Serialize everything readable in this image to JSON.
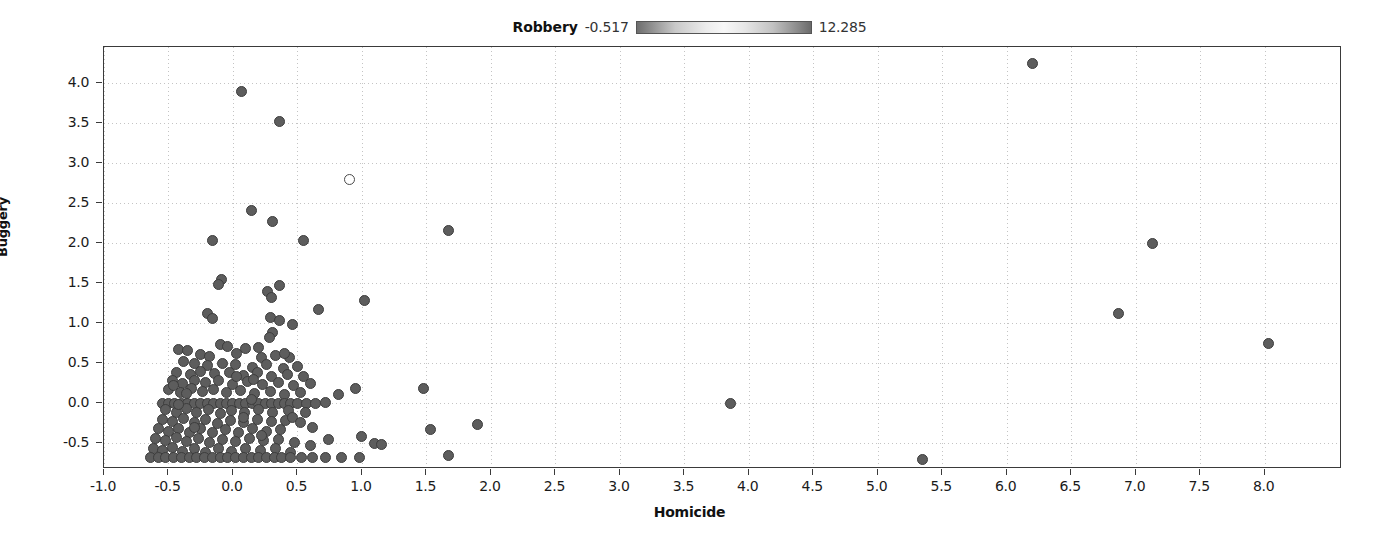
{
  "legend": {
    "title": "Robbery",
    "min": "-0.517",
    "max": "12.285",
    "colorbar_name": "robbery-colorbar",
    "gradient_low": "#6e6e6e",
    "gradient_mid": "#f7f7f7",
    "gradient_high": "#6b6b6b"
  },
  "chart_data": {
    "type": "scatter",
    "title": "Robbery",
    "xlabel": "Homicide",
    "ylabel": "Buggery",
    "xlim": [
      -1.0,
      8.6
    ],
    "ylim": [
      -0.82,
      4.45
    ],
    "grid": true,
    "legend_position": "top-center",
    "colorbar": {
      "label": "Robbery",
      "vmin": -0.517,
      "vmax": 12.285
    },
    "xticks": [
      "-1.0",
      "-0.5",
      "0.0",
      "0.5",
      "1.0",
      "1.5",
      "2.0",
      "2.5",
      "3.0",
      "3.5",
      "4.0",
      "4.5",
      "5.0",
      "5.5",
      "6.0",
      "6.5",
      "7.0",
      "7.5",
      "8.0"
    ],
    "xtickvalues": [
      -1.0,
      -0.5,
      0.0,
      0.5,
      1.0,
      1.5,
      2.0,
      2.5,
      3.0,
      3.5,
      4.0,
      4.5,
      5.0,
      5.5,
      6.0,
      6.5,
      7.0,
      7.5,
      8.0
    ],
    "yticks": [
      "-0.5",
      "0.0",
      "0.5",
      "1.0",
      "1.5",
      "2.0",
      "2.5",
      "3.0",
      "3.5",
      "4.0"
    ],
    "ytickvalues": [
      -0.5,
      0.0,
      0.5,
      1.0,
      1.5,
      2.0,
      2.5,
      3.0,
      3.5,
      4.0
    ],
    "marker": {
      "shape": "circle",
      "fill": "#5d5d5d",
      "edge": "#3d3d3d",
      "size_px": 11
    },
    "points": [
      [
        6.2,
        4.25
      ],
      [
        0.07,
        3.9
      ],
      [
        0.36,
        3.52
      ],
      [
        0.9,
        2.8
      ],
      [
        0.14,
        2.41
      ],
      [
        0.31,
        2.27
      ],
      [
        1.67,
        2.16
      ],
      [
        7.13,
        2.0
      ],
      [
        -0.16,
        2.03
      ],
      [
        0.55,
        2.03
      ],
      [
        -0.09,
        1.55
      ],
      [
        -0.11,
        1.48
      ],
      [
        0.36,
        1.47
      ],
      [
        0.27,
        1.4
      ],
      [
        0.3,
        1.32
      ],
      [
        1.02,
        1.29
      ],
      [
        6.87,
        1.12
      ],
      [
        -0.2,
        1.12
      ],
      [
        -0.16,
        1.06
      ],
      [
        0.29,
        1.07
      ],
      [
        0.36,
        1.03
      ],
      [
        0.46,
        0.99
      ],
      [
        0.66,
        1.17
      ],
      [
        0.31,
        0.88
      ],
      [
        0.28,
        0.82
      ],
      [
        8.03,
        0.75
      ],
      [
        -0.42,
        0.67
      ],
      [
        -0.35,
        0.66
      ],
      [
        -0.1,
        0.73
      ],
      [
        -0.04,
        0.71
      ],
      [
        0.1,
        0.69
      ],
      [
        0.2,
        0.7
      ],
      [
        -0.25,
        0.61
      ],
      [
        -0.18,
        0.59
      ],
      [
        0.03,
        0.62
      ],
      [
        0.22,
        0.57
      ],
      [
        0.33,
        0.6
      ],
      [
        0.44,
        0.57
      ],
      [
        -0.38,
        0.52
      ],
      [
        -0.3,
        0.5
      ],
      [
        -0.2,
        0.47
      ],
      [
        -0.08,
        0.5
      ],
      [
        0.02,
        0.48
      ],
      [
        0.15,
        0.45
      ],
      [
        0.26,
        0.48
      ],
      [
        0.39,
        0.44
      ],
      [
        0.5,
        0.46
      ],
      [
        -0.44,
        0.38
      ],
      [
        -0.33,
        0.36
      ],
      [
        -0.25,
        0.4
      ],
      [
        -0.14,
        0.37
      ],
      [
        -0.03,
        0.39
      ],
      [
        0.08,
        0.35
      ],
      [
        0.19,
        0.38
      ],
      [
        0.3,
        0.34
      ],
      [
        0.42,
        0.36
      ],
      [
        0.55,
        0.33
      ],
      [
        -0.47,
        0.28
      ],
      [
        -0.39,
        0.25
      ],
      [
        -0.3,
        0.29
      ],
      [
        -0.21,
        0.26
      ],
      [
        -0.11,
        0.28
      ],
      [
        0.0,
        0.24
      ],
      [
        0.11,
        0.27
      ],
      [
        0.23,
        0.23
      ],
      [
        0.35,
        0.26
      ],
      [
        0.47,
        0.22
      ],
      [
        0.6,
        0.25
      ],
      [
        -0.5,
        0.17
      ],
      [
        -0.41,
        0.14
      ],
      [
        -0.32,
        0.18
      ],
      [
        -0.24,
        0.15
      ],
      [
        -0.15,
        0.17
      ],
      [
        -0.05,
        0.13
      ],
      [
        0.06,
        0.16
      ],
      [
        0.17,
        0.12
      ],
      [
        0.29,
        0.15
      ],
      [
        0.4,
        0.11
      ],
      [
        0.52,
        0.14
      ],
      [
        1.48,
        0.18
      ],
      [
        0.95,
        0.18
      ],
      [
        0.82,
        0.11
      ],
      [
        -0.55,
        0.0
      ],
      [
        -0.5,
        0.0
      ],
      [
        -0.45,
        0.0
      ],
      [
        -0.4,
        0.0
      ],
      [
        -0.35,
        0.0
      ],
      [
        -0.3,
        0.0
      ],
      [
        -0.25,
        0.0
      ],
      [
        -0.2,
        0.0
      ],
      [
        -0.15,
        0.0
      ],
      [
        -0.1,
        0.0
      ],
      [
        -0.05,
        0.0
      ],
      [
        0.0,
        0.0
      ],
      [
        0.05,
        0.0
      ],
      [
        0.1,
        0.0
      ],
      [
        0.15,
        0.0
      ],
      [
        0.2,
        0.0
      ],
      [
        0.25,
        0.0
      ],
      [
        0.3,
        0.0
      ],
      [
        0.35,
        0.0
      ],
      [
        0.4,
        0.0
      ],
      [
        0.45,
        0.0
      ],
      [
        0.5,
        0.0
      ],
      [
        0.57,
        0.0
      ],
      [
        0.64,
        0.0
      ],
      [
        0.72,
        0.01
      ],
      [
        3.86,
        0.0
      ],
      [
        -0.52,
        -0.08
      ],
      [
        -0.44,
        -0.11
      ],
      [
        -0.36,
        -0.07
      ],
      [
        -0.28,
        -0.12
      ],
      [
        -0.19,
        -0.08
      ],
      [
        -0.1,
        -0.13
      ],
      [
        -0.01,
        -0.09
      ],
      [
        0.09,
        -0.12
      ],
      [
        0.2,
        -0.08
      ],
      [
        0.31,
        -0.11
      ],
      [
        0.43,
        -0.09
      ],
      [
        0.56,
        -0.12
      ],
      [
        1.9,
        -0.26
      ],
      [
        -0.55,
        -0.2
      ],
      [
        -0.47,
        -0.23
      ],
      [
        -0.38,
        -0.19
      ],
      [
        -0.3,
        -0.24
      ],
      [
        -0.21,
        -0.2
      ],
      [
        -0.12,
        -0.25
      ],
      [
        -0.02,
        -0.21
      ],
      [
        0.08,
        -0.24
      ],
      [
        0.19,
        -0.2
      ],
      [
        0.3,
        -0.23
      ],
      [
        0.41,
        -0.21
      ],
      [
        1.53,
        -0.33
      ],
      [
        -0.58,
        -0.32
      ],
      [
        -0.5,
        -0.35
      ],
      [
        -0.42,
        -0.31
      ],
      [
        -0.34,
        -0.36
      ],
      [
        -0.25,
        -0.32
      ],
      [
        -0.16,
        -0.37
      ],
      [
        -0.06,
        -0.33
      ],
      [
        0.04,
        -0.36
      ],
      [
        0.15,
        -0.32
      ],
      [
        0.26,
        -0.35
      ],
      [
        0.37,
        -0.33
      ],
      [
        1.0,
        -0.42
      ],
      [
        1.1,
        -0.5
      ],
      [
        1.15,
        -0.52
      ],
      [
        -0.6,
        -0.44
      ],
      [
        -0.52,
        -0.47
      ],
      [
        -0.44,
        -0.43
      ],
      [
        -0.36,
        -0.48
      ],
      [
        -0.27,
        -0.44
      ],
      [
        -0.18,
        -0.49
      ],
      [
        -0.08,
        -0.45
      ],
      [
        0.02,
        -0.48
      ],
      [
        0.13,
        -0.44
      ],
      [
        0.24,
        -0.47
      ],
      [
        0.35,
        -0.45
      ],
      [
        0.48,
        -0.49
      ],
      [
        0.6,
        -0.53
      ],
      [
        1.67,
        -0.65
      ],
      [
        5.35,
        -0.7
      ],
      [
        -0.62,
        -0.56
      ],
      [
        -0.55,
        -0.59
      ],
      [
        -0.47,
        -0.55
      ],
      [
        -0.39,
        -0.6
      ],
      [
        -0.3,
        -0.56
      ],
      [
        -0.21,
        -0.61
      ],
      [
        -0.11,
        -0.57
      ],
      [
        -0.01,
        -0.6
      ],
      [
        0.1,
        -0.56
      ],
      [
        0.21,
        -0.59
      ],
      [
        0.33,
        -0.57
      ],
      [
        0.45,
        -0.61
      ],
      [
        -0.64,
        -0.68
      ],
      [
        -0.58,
        -0.68
      ],
      [
        -0.52,
        -0.68
      ],
      [
        -0.46,
        -0.68
      ],
      [
        -0.4,
        -0.68
      ],
      [
        -0.34,
        -0.68
      ],
      [
        -0.28,
        -0.68
      ],
      [
        -0.22,
        -0.68
      ],
      [
        -0.16,
        -0.68
      ],
      [
        -0.1,
        -0.68
      ],
      [
        -0.04,
        -0.68
      ],
      [
        0.02,
        -0.68
      ],
      [
        0.08,
        -0.68
      ],
      [
        0.14,
        -0.68
      ],
      [
        0.2,
        -0.68
      ],
      [
        0.26,
        -0.68
      ],
      [
        0.32,
        -0.68
      ],
      [
        0.38,
        -0.68
      ],
      [
        0.45,
        -0.68
      ],
      [
        0.53,
        -0.68
      ],
      [
        0.62,
        -0.68
      ],
      [
        0.72,
        -0.68
      ],
      [
        0.84,
        -0.68
      ],
      [
        0.98,
        -0.68
      ],
      [
        -0.46,
        0.22
      ],
      [
        -0.42,
        -0.02
      ],
      [
        -0.36,
        0.12
      ],
      [
        -0.3,
        -0.3
      ],
      [
        0.16,
        0.3
      ],
      [
        0.22,
        -0.4
      ],
      [
        0.08,
        -0.18
      ],
      [
        0.14,
        0.05
      ],
      [
        0.03,
        0.33
      ],
      [
        0.46,
        -0.18
      ],
      [
        0.52,
        -0.24
      ],
      [
        0.62,
        -0.3
      ],
      [
        0.74,
        -0.45
      ],
      [
        0.4,
        0.62
      ]
    ],
    "open_points": [
      [
        0.9,
        2.8
      ]
    ]
  }
}
